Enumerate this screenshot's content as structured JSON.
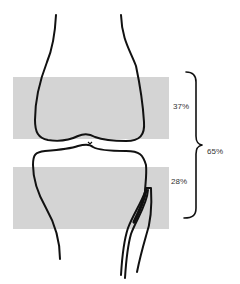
{
  "diagram": {
    "type": "knee-joint-schematic",
    "colors": {
      "band": "#d4d4d4",
      "outline": "#111111",
      "text": "#333333"
    },
    "bands": [
      {
        "name": "femur-band",
        "label": "37%"
      },
      {
        "name": "tibia-band",
        "label": "28%"
      }
    ],
    "brace": {
      "label": "65%"
    }
  }
}
